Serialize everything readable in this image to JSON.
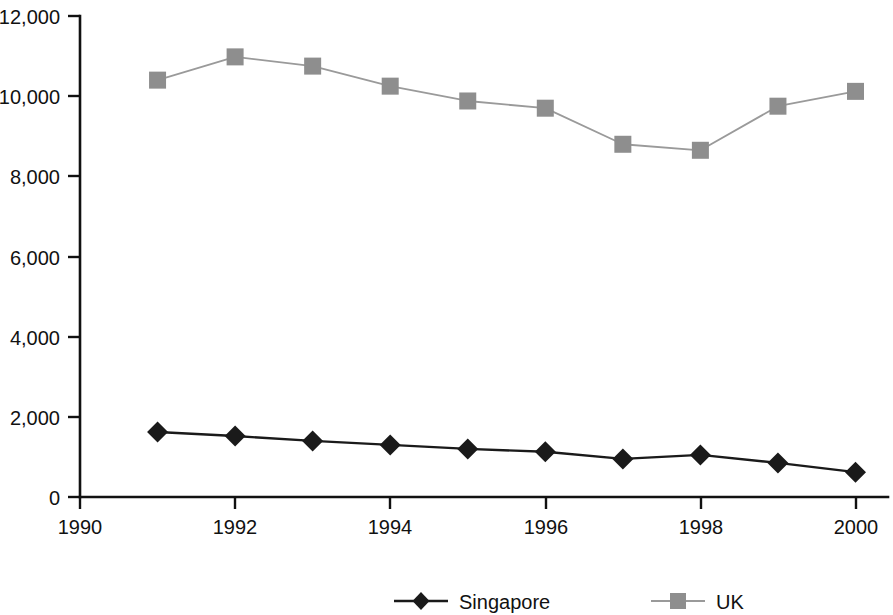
{
  "chart_data": {
    "type": "line",
    "title": "",
    "subtitle": "",
    "xlabel": "",
    "ylabel": "",
    "x": [
      1991,
      1992,
      1993,
      1994,
      1995,
      1996,
      1997,
      1998,
      1999,
      2000
    ],
    "categories": [
      "1991",
      "1992",
      "1993",
      "1994",
      "1995",
      "1996",
      "1997",
      "1998",
      "1999",
      "2000"
    ],
    "series": [
      {
        "name": "Singapore",
        "marker": "diamond",
        "color": "#1a1a1a",
        "values": [
          1620,
          1520,
          1400,
          1300,
          1200,
          1130,
          950,
          1050,
          850,
          620
        ]
      },
      {
        "name": "UK",
        "marker": "square",
        "color": "#8e8e8e",
        "values": [
          10400,
          10980,
          10750,
          10250,
          9880,
          9700,
          8800,
          8650,
          9750,
          10120
        ]
      }
    ],
    "xlim": [
      1990,
      2000.6
    ],
    "ylim": [
      0,
      12000
    ],
    "grid": false,
    "legend_position": "bottom",
    "x_ticks": [
      1990,
      1992,
      1994,
      1996,
      1998,
      2000
    ],
    "x_tick_labels": [
      "1990",
      "1992",
      "1994",
      "1996",
      "1998",
      "2000"
    ],
    "x_minor_ticks": [
      1991,
      1993,
      1995,
      1997,
      1999
    ],
    "y_ticks": [
      0,
      2000,
      4000,
      6000,
      8000,
      10000,
      12000
    ],
    "y_tick_labels": [
      "0",
      "2,000",
      "4,000",
      "6,000",
      "8,000",
      "10,000",
      "12,000"
    ]
  },
  "legend": {
    "entries": [
      {
        "label": "Singapore",
        "marker": "diamond-marker-icon",
        "color": "#1a1a1a"
      },
      {
        "label": "UK",
        "marker": "square-marker-icon",
        "color": "#8e8e8e"
      }
    ]
  },
  "axes": {
    "y_tick_labels": [
      "12,000",
      "10,000",
      "8,000",
      "6,000",
      "4,000",
      "2,000",
      "0"
    ],
    "x_tick_labels": [
      "1990",
      "1992",
      "1994",
      "1996",
      "1998",
      "2000"
    ]
  }
}
